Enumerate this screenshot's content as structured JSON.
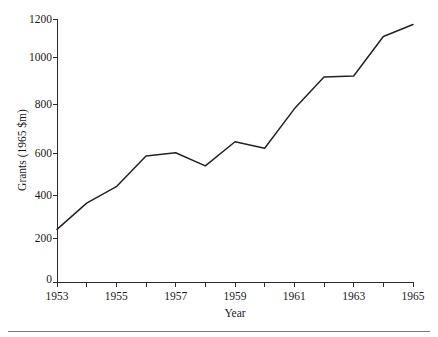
{
  "chart_data": {
    "type": "line",
    "title": "",
    "subtitle": "",
    "xlabel": "Year",
    "ylabel": "Grants (1965 $m)",
    "xlim": [
      1953,
      1965
    ],
    "ylim": [
      0,
      1200
    ],
    "grid": false,
    "legend": null,
    "x": [
      1953,
      1954,
      1955,
      1956,
      1957,
      1958,
      1959,
      1960,
      1961,
      1962,
      1963,
      1964,
      1965
    ],
    "values": [
      240,
      360,
      435,
      575,
      590,
      530,
      640,
      610,
      790,
      935,
      940,
      1120,
      1175
    ],
    "series": [
      {
        "name": "Grants",
        "color": "#232323",
        "values": [
          240,
          360,
          435,
          575,
          590,
          530,
          640,
          610,
          790,
          935,
          940,
          1120,
          1175
        ]
      }
    ],
    "x_tick_labels": [
      "1953",
      "",
      "1955",
      "",
      "1957",
      "",
      "1959",
      "",
      "1961",
      "",
      "1963",
      "",
      "1965"
    ],
    "x_major_labels": [
      "1953",
      "1955",
      "1957",
      "1959",
      "1961",
      "1963",
      "1965"
    ],
    "y_tick_labels": [
      "0",
      "200",
      "400",
      "600",
      "800",
      "1000",
      "1200"
    ],
    "y_ticks": [
      0,
      200,
      400,
      600,
      800,
      1000,
      1200
    ]
  },
  "axes": {
    "y_label": "Grants (1965 $m)",
    "x_label": "Year"
  },
  "colors": {
    "line": "#232323",
    "axis": "#2b2b2b",
    "text": "#1a1a1a",
    "rule": "#7a7a7a",
    "background": "#ffffff"
  }
}
